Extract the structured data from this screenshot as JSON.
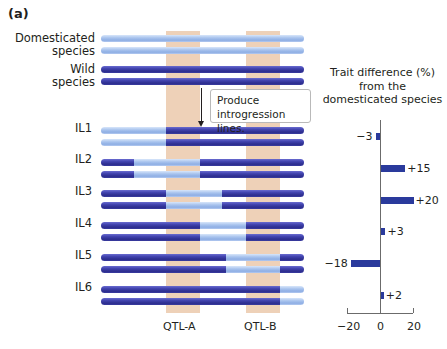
{
  "panel_label": "(a)",
  "labels": {
    "domesticated": [
      "Domesticated",
      "species"
    ],
    "wild": [
      "Wild",
      "species"
    ],
    "lines": [
      "IL1",
      "IL2",
      "IL3",
      "IL4",
      "IL5",
      "IL6"
    ]
  },
  "callout": [
    "Produce",
    "introgression lines."
  ],
  "qtl": {
    "a_label": "QTL-A",
    "b_label": "QTL-B"
  },
  "colors": {
    "domesticated_chromosome": "#a9c4ee",
    "wild_chromosome": "#3a3ca0",
    "qtl_column": "#ecccb0",
    "bar": "#2a3a9c"
  },
  "chromosomes": {
    "x_start": 101,
    "x_end": 304,
    "rows": [
      {
        "name": "domesticated",
        "y": [
          35,
          47
        ],
        "segments": [
          [
            "light",
            101,
            304
          ]
        ]
      },
      {
        "name": "wild",
        "y": [
          66,
          78
        ],
        "segments": [
          [
            "dark",
            101,
            304
          ]
        ]
      },
      {
        "name": "IL1",
        "y": [
          127,
          139
        ],
        "segments": [
          [
            "light",
            101,
            166
          ],
          [
            "dark",
            166,
            304
          ]
        ]
      },
      {
        "name": "IL2",
        "y": [
          159,
          171
        ],
        "segments": [
          [
            "dark",
            101,
            134
          ],
          [
            "light",
            134,
            200
          ],
          [
            "dark",
            200,
            304
          ]
        ]
      },
      {
        "name": "IL3",
        "y": [
          190,
          202
        ],
        "segments": [
          [
            "dark",
            101,
            166
          ],
          [
            "light",
            166,
            222
          ],
          [
            "dark",
            222,
            304
          ]
        ]
      },
      {
        "name": "IL4",
        "y": [
          222,
          234
        ],
        "segments": [
          [
            "dark",
            101,
            200
          ],
          [
            "light",
            200,
            246
          ],
          [
            "dark",
            246,
            304
          ]
        ]
      },
      {
        "name": "IL5",
        "y": [
          254,
          266
        ],
        "segments": [
          [
            "dark",
            101,
            226
          ],
          [
            "light",
            226,
            280
          ],
          [
            "dark",
            280,
            304
          ]
        ]
      },
      {
        "name": "IL6",
        "y": [
          286,
          298
        ],
        "segments": [
          [
            "dark",
            101,
            280
          ],
          [
            "light",
            280,
            304
          ]
        ]
      }
    ]
  },
  "chart_data": {
    "type": "bar",
    "orientation": "horizontal",
    "title": "Trait difference (%) from the domesticated species",
    "title_lines": [
      "Trait difference (%)",
      "from the",
      "domesticated species"
    ],
    "categories": [
      "IL1",
      "IL2",
      "IL3",
      "IL4",
      "IL5",
      "IL6"
    ],
    "values": [
      -3,
      15,
      20,
      3,
      -18,
      2
    ],
    "value_labels": [
      "−3",
      "+15",
      "+20",
      "+3",
      "−18",
      "+2"
    ],
    "xlabel": "",
    "ylabel": "",
    "xlim": [
      -20,
      20
    ],
    "x_ticks": [
      -20,
      0,
      20
    ],
    "x_tick_labels": [
      "−20",
      "0",
      "20"
    ],
    "grid": false,
    "legend": null
  }
}
